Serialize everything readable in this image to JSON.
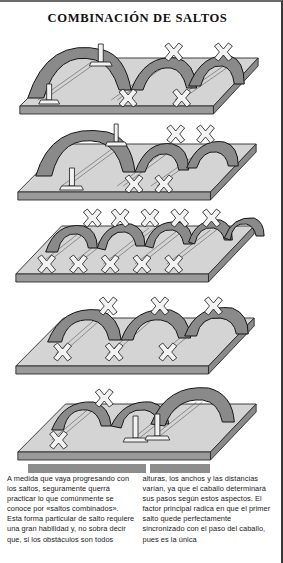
{
  "document": {
    "title": "COMBINACIÓN DE SALTOS",
    "language": "es"
  },
  "figure": {
    "alt_name": "combination-jumps-illustration",
    "panel_count": 5,
    "panels": [
      {
        "index": 1,
        "name": "panel-large-then-small-arcs",
        "arcs": 3,
        "arc_sizes": [
          "large",
          "medium",
          "medium"
        ],
        "markers": [
          "vertical-pole",
          "cross-rail",
          "cross-rail",
          "cross-rail",
          "cross-rail"
        ]
      },
      {
        "index": 2,
        "name": "panel-large-arc-two-small",
        "arcs": 3,
        "arc_sizes": [
          "large",
          "small",
          "small"
        ],
        "markers": [
          "vertical-pole",
          "cross-rail",
          "cross-rail",
          "cross-rail",
          "cross-rail"
        ]
      },
      {
        "index": 3,
        "name": "panel-five-equal-arcs",
        "arcs": 5,
        "arc_sizes": [
          "small",
          "small",
          "small",
          "small",
          "small"
        ],
        "markers": [
          "cross-rail",
          "cross-rail",
          "cross-rail",
          "cross-rail",
          "cross-rail"
        ]
      },
      {
        "index": 4,
        "name": "panel-three-equal-arcs",
        "arcs": 3,
        "arc_sizes": [
          "medium",
          "medium",
          "medium"
        ],
        "markers": [
          "cross-rail",
          "cross-rail",
          "cross-rail",
          "cross-rail",
          "cross-rail",
          "cross-rail"
        ]
      },
      {
        "index": 5,
        "name": "panel-two-small-one-large-arc",
        "arcs": 3,
        "arc_sizes": [
          "medium",
          "medium",
          "large"
        ],
        "markers": [
          "cross-rail",
          "cross-rail",
          "vertical-pole",
          "vertical-pole"
        ]
      }
    ],
    "colors": {
      "platform_top": "#d4d4d4",
      "platform_side": "#8f8f8f",
      "arc_ribbon": "#8a8a8a",
      "arc_outline": "#1a1a1a",
      "marker_fill": "#f2f2f2",
      "background": "#ffffff"
    }
  },
  "caption": {
    "left_column": "A medida que vaya progresando con los saltos, seguramente querrá practicar lo que comúnmente se conoce por «saltos combinados». Esta forma particular de salto requiere una gran habilidad y, no sobra decir que, si los obstáculos son todos",
    "right_column": "alturas, los anchos y las distancias varían, ya que el caballo determinará sus pasos según estos aspectos. El factor principal radica en que el primer salto quede perfectamente sincronizado con el paso del caballo, pues es la única"
  }
}
